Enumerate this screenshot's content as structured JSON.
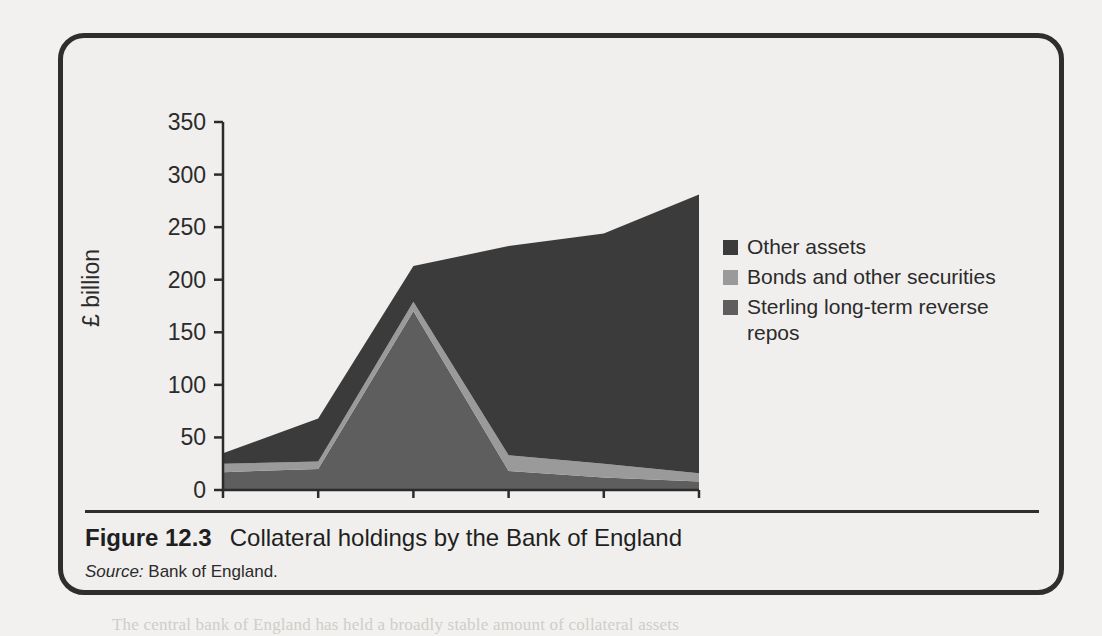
{
  "figure": {
    "caption_number": "Figure 12.3",
    "caption_title": "Collateral holdings by the Bank of England",
    "source_label": "Source:",
    "source_value": "Bank of England."
  },
  "legend": {
    "items": [
      {
        "label": "Other assets",
        "color": "#3b3b3b"
      },
      {
        "label": "Bonds and other securities",
        "color": "#9a9a9a"
      },
      {
        "label": "Sterling long-term reverse repos",
        "color": "#5e5e5e"
      }
    ]
  },
  "colors": {
    "other_assets": "#3b3b3b",
    "bonds": "#9a9a9a",
    "sterling_repos": "#5e5e5e",
    "axis": "#2b2b2b",
    "plot_background": "#f0efed",
    "frame": "#2e2e2e",
    "page_background": "#f2f1ef"
  },
  "chart_data": {
    "type": "area",
    "title": "Collateral holdings by the Bank of England",
    "xlabel": "",
    "ylabel": "£ billion",
    "categories": [
      "Jan 06",
      "Jan 07",
      "Jan 08",
      "Jan 09",
      "Jan 10",
      "Jan 11"
    ],
    "yticks": [
      0,
      50,
      100,
      150,
      200,
      250,
      300,
      350
    ],
    "ylim": [
      0,
      350
    ],
    "grid": false,
    "stacked": true,
    "legend_position": "inside-right",
    "series": [
      {
        "name": "Sterling long-term reverse repos",
        "color": "#5e5e5e",
        "values": [
          17,
          20,
          170,
          18,
          12,
          8
        ]
      },
      {
        "name": "Bonds and other securities",
        "color": "#9a9a9a",
        "values": [
          8,
          7,
          9,
          15,
          13,
          8
        ]
      },
      {
        "name": "Other assets",
        "color": "#3b3b3b",
        "values": [
          10,
          41,
          34,
          199,
          219,
          265
        ]
      }
    ],
    "totals": [
      35,
      68,
      213,
      232,
      244,
      281
    ]
  },
  "ghost_text": {
    "lines": [
      {
        "x": 112,
        "y": 92,
        "text": "surplus, the central bank reverses its holdings of the  earlier transaction, thereby"
      },
      {
        "x": 112,
        "y": 117,
        "text": "draining the liquidity. In a bank run, under no pretence will the central bank be able to use a"
      },
      {
        "x": 112,
        "y": 142,
        "text": "reverse repo transaction, as it will have to settle for the last leg  of a second kind of trading."
      },
      {
        "x": 112,
        "y": 167,
        "text": "The increasing size of the balance sheet of a central bank can lead to a range of policy"
      },
      {
        "x": 112,
        "y": 192,
        "text": "implementation problems that may be associated not only with the quantity but also with the"
      },
      {
        "x": 112,
        "y": 217,
        "text": "composition of the assets of the central bank. The key issue here is whether the  monetary"
      },
      {
        "x": 112,
        "y": 242,
        "text": "control be maintained on the back of a much larger balance sheet and  whether the central"
      },
      {
        "x": 112,
        "y": 267,
        "text": "bank has the capacity of sustaining various quantities of assets on its books."
      },
      {
        "x": 112,
        "y": 345,
        "text": "The accepted method for sterilising its own currency and other assets held by the central"
      },
      {
        "x": 112,
        "y": 370,
        "text": "bank  is  the  head  of  the  UK  banking  system  and  it  operated  by  effecting  the"
      },
      {
        "x": 112,
        "y": 395,
        "text": "adjustment  action,  by  means  of  asset  purchases  and  sales,  of  the  composition"
      },
      {
        "x": 112,
        "y": 420,
        "text": "broken  down  to  bullion  and  foreign  currency  holdings  and  the  accumulated"
      },
      {
        "x": 112,
        "y": 445,
        "text": "government  securities  as  the  primary  instrument."
      },
      {
        "x": 112,
        "y": 520,
        "text": "more  sophisticated  means  of  monetary  settlement."
      },
      {
        "x": 112,
        "y": 612,
        "text": "The  central  bank  of  England  has  held  a  broadly  stable  amount  of  collateral  assets"
      }
    ]
  }
}
